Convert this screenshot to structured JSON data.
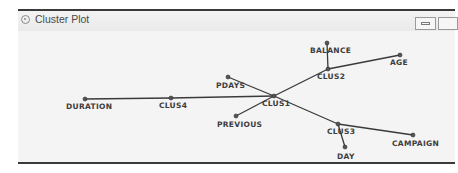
{
  "window": {
    "title": "Cluster Plot",
    "icon": "cluster-plot-icon",
    "buttons": [
      {
        "name": "minimize-button",
        "icon": "minimize-icon"
      },
      {
        "name": "maximize-button",
        "icon": "maximize-icon"
      }
    ]
  },
  "diagram": {
    "type": "cluster-tree",
    "nodes": [
      {
        "id": "CLUS1",
        "label": "CLUS1",
        "x": 274,
        "y": 96,
        "lx": 262,
        "ly": 106
      },
      {
        "id": "CLUS2",
        "label": "CLUS2",
        "x": 328,
        "y": 69,
        "lx": 317,
        "ly": 79
      },
      {
        "id": "CLUS3",
        "label": "CLUS3",
        "x": 338,
        "y": 124,
        "lx": 327,
        "ly": 134
      },
      {
        "id": "CLUS4",
        "label": "CLUS4",
        "x": 171,
        "y": 98,
        "lx": 159,
        "ly": 108
      },
      {
        "id": "BALANCE",
        "label": "BALANCE",
        "x": 327,
        "y": 43,
        "lx": 310,
        "ly": 53
      },
      {
        "id": "AGE",
        "label": "AGE",
        "x": 400,
        "y": 55,
        "lx": 390,
        "ly": 65
      },
      {
        "id": "PDAYS",
        "label": "PDAYS",
        "x": 228,
        "y": 77,
        "lx": 216,
        "ly": 88
      },
      {
        "id": "PREVIOUS",
        "label": "PREVIOUS",
        "x": 236,
        "y": 116,
        "lx": 217,
        "ly": 127
      },
      {
        "id": "DURATION",
        "label": "DURATION",
        "x": 85,
        "y": 99,
        "lx": 66,
        "ly": 109
      },
      {
        "id": "DAY",
        "label": "DAY",
        "x": 345,
        "y": 147,
        "lx": 337,
        "ly": 159
      },
      {
        "id": "CAMPAIGN",
        "label": "CAMPAIGN",
        "x": 413,
        "y": 135,
        "lx": 392,
        "ly": 146
      }
    ],
    "edges": [
      [
        "CLUS1",
        "CLUS2"
      ],
      [
        "CLUS1",
        "CLUS3"
      ],
      [
        "CLUS1",
        "CLUS4"
      ],
      [
        "CLUS1",
        "PDAYS"
      ],
      [
        "CLUS1",
        "PREVIOUS"
      ],
      [
        "CLUS2",
        "BALANCE"
      ],
      [
        "CLUS2",
        "AGE"
      ],
      [
        "CLUS3",
        "DAY"
      ],
      [
        "CLUS3",
        "CAMPAIGN"
      ],
      [
        "CLUS4",
        "DURATION"
      ]
    ],
    "colors": {
      "edge": "#3a3a3a",
      "node": "#555555",
      "label": "#3c3c3c"
    }
  }
}
